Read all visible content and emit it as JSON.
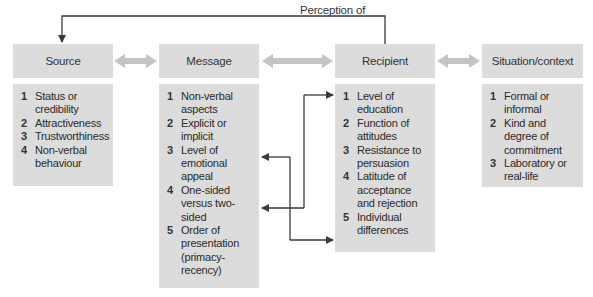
{
  "diagram": {
    "feedback_label": "Perception of",
    "columns": [
      {
        "id": "source",
        "title": "Source",
        "items": [
          {
            "n": "1",
            "text": "Status or credibility"
          },
          {
            "n": "2",
            "text": "Attractiveness"
          },
          {
            "n": "3",
            "text": "Trustworthiness"
          },
          {
            "n": "4",
            "text": "Non-verbal behaviour"
          }
        ]
      },
      {
        "id": "message",
        "title": "Message",
        "items": [
          {
            "n": "1",
            "text": "Non-verbal aspects"
          },
          {
            "n": "2",
            "text": "Explicit or implicit"
          },
          {
            "n": "3",
            "text": "Level of emotional appeal"
          },
          {
            "n": "4",
            "text": "One-sided versus two-sided"
          },
          {
            "n": "5",
            "text": "Order of presentation (primacy-recency)"
          }
        ]
      },
      {
        "id": "recipient",
        "title": "Recipient",
        "items": [
          {
            "n": "1",
            "text": "Level of education"
          },
          {
            "n": "2",
            "text": "Function of attitudes"
          },
          {
            "n": "3",
            "text": "Resistance to persuasion"
          },
          {
            "n": "4",
            "text": "Latitude of acceptance and rejection"
          },
          {
            "n": "5",
            "text": "Individual differences"
          }
        ]
      },
      {
        "id": "situation",
        "title": "Situation/context",
        "items": [
          {
            "n": "1",
            "text": "Formal or informal"
          },
          {
            "n": "2",
            "text": "Kind and degree of commitment"
          },
          {
            "n": "3",
            "text": "Laboratory or real-life"
          }
        ]
      }
    ],
    "colors": {
      "box_fill": "#dcdcdc",
      "double_arrow": "#c4c4c4",
      "line": "#3a3a3a"
    }
  }
}
